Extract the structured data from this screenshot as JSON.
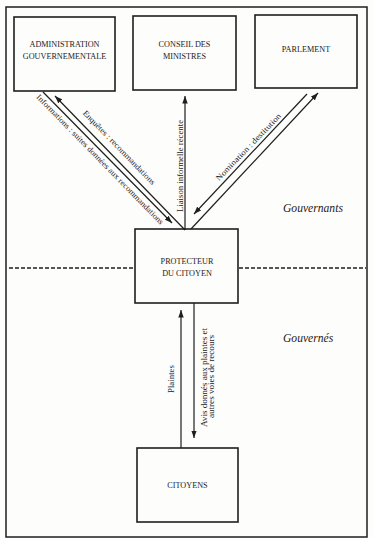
{
  "diagram": {
    "boxes": {
      "administration": {
        "line1": "ADMINISTRATION",
        "line2": "GOUVERNEMENTALE"
      },
      "conseil": {
        "line1": "CONSEIL DES",
        "line2": "MINISTRES"
      },
      "parlement": {
        "line1": "PARLEMENT"
      },
      "protecteur": {
        "line1": "PROTECTEUR",
        "line2": "DU CITOYEN"
      },
      "citoyens": {
        "line1": "CITOYENS"
      }
    },
    "arrows": {
      "enquetes": "Enquêtes : recommandations",
      "informations": "Informations : suites données aux recommandations",
      "liaison": "Liaison informelle récente",
      "nomination": "Nomination : destitution",
      "plaintes": "Plaintes",
      "avis_line1": "Avis donnés aux plaintes et",
      "avis_line2": "autres voies de recours"
    },
    "zones": {
      "upper": "Gouvernants",
      "lower": "Gouvernés"
    }
  }
}
